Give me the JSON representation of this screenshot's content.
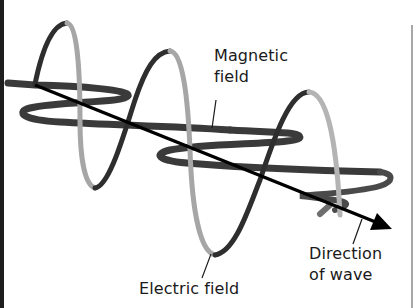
{
  "diagram": {
    "labels": {
      "magnetic": {
        "line1": "Magnetic",
        "line2": "field"
      },
      "electric": {
        "text": "Electric field"
      },
      "direction": {
        "line1": "Direction",
        "line2": "of wave"
      }
    },
    "colors": {
      "background": "#ffffff",
      "text": "#1a1a1a",
      "electric_dark": "#2e2e2e",
      "electric_light": "#a6a6a6",
      "magnetic_dark": "#3a3a3a",
      "magnetic_mid": "#6e6e6e",
      "arrow": "#000000",
      "frame_left": "#1e1e1e",
      "frame_right": "#a8a8a8"
    },
    "components": [
      {
        "name": "electric-field-wave",
        "orientation": "vertical",
        "description": "sinusoidal ribbon oscillating up and down"
      },
      {
        "name": "magnetic-field-wave",
        "orientation": "horizontal",
        "description": "sinusoidal ribbon oscillating side to side, perpendicular to electric field"
      },
      {
        "name": "direction-arrow",
        "description": "arrow showing propagation direction from upper-left to lower-right"
      }
    ]
  }
}
